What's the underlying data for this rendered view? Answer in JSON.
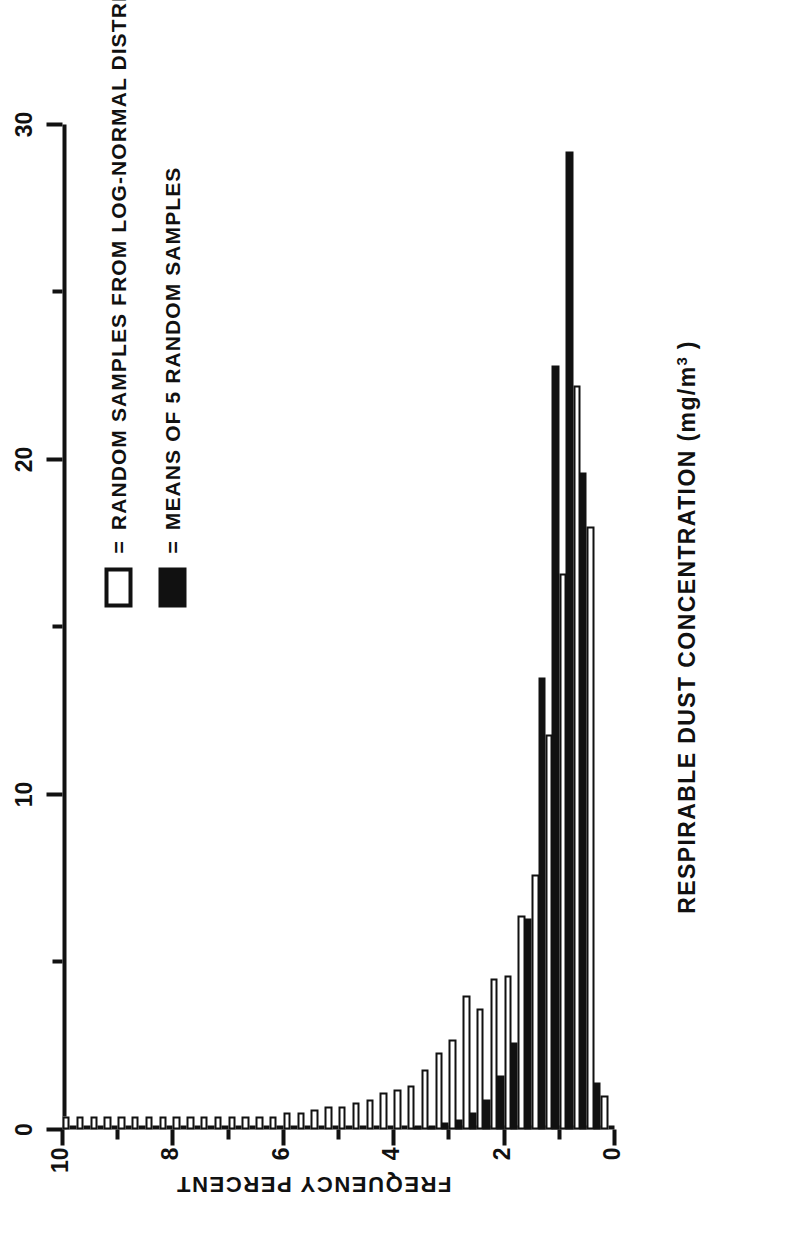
{
  "chart_data": {
    "type": "bar",
    "orientation": "histogram-rotated",
    "title": "",
    "xlabel": "RESPIRABLE  DUST  CONCENTRATION  (mg/m",
    "xlabel_sup": "3",
    "xlabel_close": " )",
    "ylabel": "FREQUENCY PERCENT",
    "xlim": [
      0,
      10
    ],
    "ylim": [
      0,
      30
    ],
    "x_ticks": [
      0,
      2,
      4,
      6,
      8,
      10
    ],
    "x_tick_labels": [
      "0",
      "2",
      "4",
      "6",
      "8",
      "10"
    ],
    "x_minor_ticks": [
      1,
      3,
      5,
      7,
      9
    ],
    "y_ticks": [
      0,
      10,
      20,
      30
    ],
    "y_tick_labels": [
      "0",
      "10",
      "20",
      "30"
    ],
    "y_minor_ticks": [
      5,
      15,
      25
    ],
    "grid": false,
    "bin_width": 0.25,
    "bin_starts": [
      0.0,
      0.25,
      0.5,
      0.75,
      1.0,
      1.25,
      1.5,
      1.75,
      2.0,
      2.25,
      2.5,
      2.75,
      3.0,
      3.25,
      3.5,
      3.75,
      4.0,
      4.25,
      4.5,
      4.75,
      5.0,
      5.25,
      5.5,
      5.75,
      6.0,
      6.25,
      6.5,
      6.75,
      7.0,
      7.25,
      7.5,
      7.75,
      8.0,
      8.25,
      8.5,
      8.75,
      9.0,
      9.25,
      9.5,
      9.75
    ],
    "series": [
      {
        "name": "RANDOM SAMPLES FROM LOG-NORMAL DISTRIBUTION",
        "style": "open",
        "color": "#ffffff",
        "edge_color": "#111111",
        "values": [
          1.0,
          18.0,
          22.2,
          16.6,
          11.8,
          7.6,
          6.4,
          4.6,
          4.5,
          3.6,
          4.0,
          2.7,
          2.3,
          1.8,
          1.3,
          1.2,
          1.1,
          0.9,
          0.8,
          0.7,
          0.7,
          0.6,
          0.5,
          0.5,
          0.4,
          0.4,
          0.4,
          0.4,
          0.4,
          0.4,
          0.4,
          0.4,
          0.4,
          0.4,
          0.4,
          0.4,
          0.4,
          0.4,
          0.4,
          0.4
        ]
      },
      {
        "name": "MEANS OF 5 RANDOM SAMPLES",
        "style": "filled",
        "color": "#111111",
        "edge_color": "#111111",
        "values": [
          0.0,
          1.4,
          19.6,
          29.2,
          22.8,
          13.5,
          6.3,
          2.6,
          1.6,
          0.9,
          0.5,
          0.3,
          0.2,
          0.1,
          0.1,
          0.0,
          0.0,
          0.0,
          0.0,
          0.0,
          0.0,
          0.0,
          0.0,
          0.0,
          0.0,
          0.0,
          0.0,
          0.0,
          0.0,
          0.0,
          0.0,
          0.0,
          0.0,
          0.0,
          0.0,
          0.0,
          0.0,
          0.0,
          0.0,
          0.0
        ]
      }
    ],
    "legend": {
      "position": "upper-right-inside",
      "entries": [
        {
          "marker": "open-square",
          "eq": "=",
          "label": "RANDOM SAMPLES FROM LOG-NORMAL DISTRIBUTION"
        },
        {
          "marker": "filled-square",
          "eq": "=",
          "label": "MEANS OF 5 RANDOM SAMPLES"
        }
      ]
    },
    "colors": {
      "ink": "#111111",
      "background": "#ffffff"
    }
  }
}
